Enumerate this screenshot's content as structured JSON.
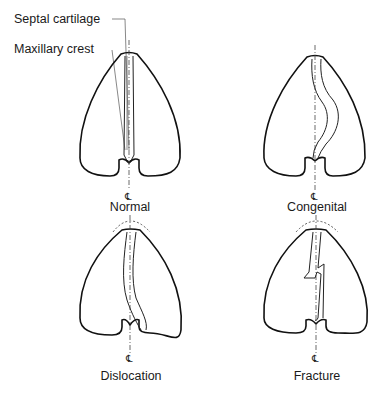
{
  "labels": {
    "septal_cartilage": "Septal cartilage",
    "maxillary_crest": "Maxillary crest"
  },
  "panels": [
    {
      "id": "normal",
      "caption": "Normal"
    },
    {
      "id": "congenital",
      "caption": "Congenital"
    },
    {
      "id": "dislocation",
      "caption": "Dislocation"
    },
    {
      "id": "fracture",
      "caption": "Fracture"
    }
  ],
  "centerline_symbol": "℄"
}
